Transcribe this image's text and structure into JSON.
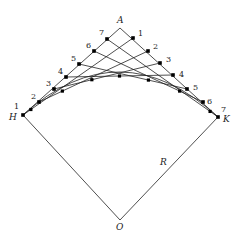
{
  "diagram": {
    "title": "",
    "points": {
      "A": {
        "label": "A",
        "x": 120,
        "y": 28,
        "lx": 117,
        "ly": 23
      },
      "H": {
        "label": "H",
        "x": 23,
        "y": 115,
        "lx": 9,
        "ly": 120
      },
      "K": {
        "label": "K",
        "x": 218,
        "y": 117,
        "lx": 223,
        "ly": 122
      },
      "O": {
        "label": "O",
        "x": 120,
        "y": 220,
        "lx": 116,
        "ly": 230
      },
      "R": {
        "label": "R",
        "lx": 160,
        "ly": 165
      }
    },
    "left_points": [
      {
        "n": "1",
        "x": 23,
        "y": 115,
        "lx": 14,
        "ly": 109
      },
      {
        "n": "2",
        "x": 39,
        "y": 102,
        "lx": 31,
        "ly": 99
      },
      {
        "n": "3",
        "x": 54,
        "y": 89,
        "lx": 46,
        "ly": 86
      },
      {
        "n": "4",
        "x": 66,
        "y": 77,
        "lx": 58,
        "ly": 74
      },
      {
        "n": "5",
        "x": 79,
        "y": 64,
        "lx": 71,
        "ly": 61
      },
      {
        "n": "6",
        "x": 94,
        "y": 51,
        "lx": 86,
        "ly": 48
      },
      {
        "n": "7",
        "x": 107,
        "y": 39,
        "lx": 99,
        "ly": 35
      }
    ],
    "right_points": [
      {
        "n": "1",
        "x": 133,
        "y": 38,
        "lx": 138,
        "ly": 36
      },
      {
        "n": "2",
        "x": 148,
        "y": 51,
        "lx": 153,
        "ly": 49
      },
      {
        "n": "3",
        "x": 160,
        "y": 63,
        "lx": 166,
        "ly": 62
      },
      {
        "n": "4",
        "x": 173,
        "y": 75,
        "lx": 179,
        "ly": 77
      },
      {
        "n": "5",
        "x": 187,
        "y": 89,
        "lx": 193,
        "ly": 90
      },
      {
        "n": "6",
        "x": 203,
        "y": 102,
        "lx": 207,
        "ly": 104
      },
      {
        "n": "7",
        "x": 218,
        "y": 117,
        "lx": 221,
        "ly": 112
      }
    ],
    "stroke_color": "#222222",
    "point_color": "#000000"
  }
}
